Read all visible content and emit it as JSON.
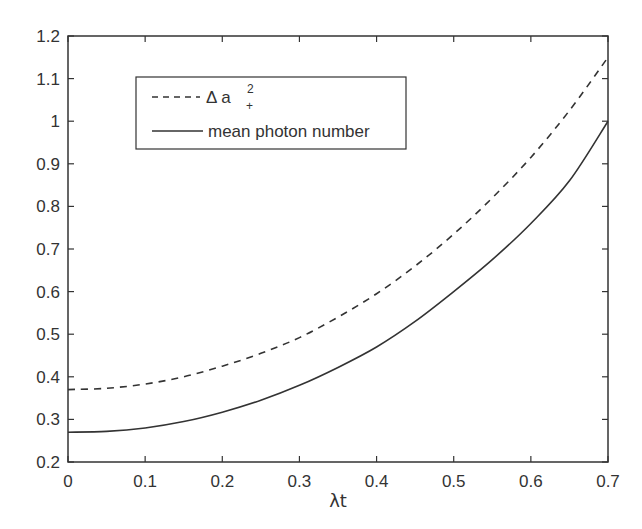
{
  "chart_data": {
    "type": "line",
    "title": "",
    "xlabel": "λt",
    "ylabel": "",
    "xlim": [
      0,
      0.7
    ],
    "ylim": [
      0.2,
      1.2
    ],
    "grid": false,
    "legend_position": "upper left (inset)",
    "x_ticks": [
      "0",
      "0.1",
      "0.2",
      "0.3",
      "0.4",
      "0.5",
      "0.6",
      "0.7"
    ],
    "y_ticks": [
      "0.2",
      "0.3",
      "0.4",
      "0.5",
      "0.6",
      "0.7",
      "0.8",
      "0.9",
      "1",
      "1.1",
      "1.2"
    ],
    "x": [
      0,
      0.05,
      0.1,
      0.15,
      0.2,
      0.25,
      0.3,
      0.35,
      0.4,
      0.45,
      0.5,
      0.55,
      0.6,
      0.65,
      0.7
    ],
    "series": [
      {
        "name": "Δ a₊²",
        "legend_main": "Δ a",
        "legend_sup": "2",
        "legend_sub": "+",
        "style": "dashed",
        "color": "#333333",
        "values": [
          0.37,
          0.373,
          0.383,
          0.4,
          0.425,
          0.455,
          0.492,
          0.54,
          0.595,
          0.66,
          0.735,
          0.82,
          0.915,
          1.025,
          1.15
        ]
      },
      {
        "name": "mean photon number",
        "legend_main": "mean photon number",
        "style": "solid",
        "color": "#333333",
        "values": [
          0.27,
          0.272,
          0.28,
          0.295,
          0.317,
          0.345,
          0.38,
          0.422,
          0.47,
          0.53,
          0.6,
          0.675,
          0.76,
          0.86,
          1.0
        ]
      }
    ]
  }
}
